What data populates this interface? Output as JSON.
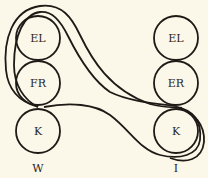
{
  "diagram": {
    "columns": [
      {
        "label": "W",
        "nodes": [
          "EL",
          "FR",
          "K"
        ]
      },
      {
        "label": "I",
        "nodes": [
          "EL",
          "ER",
          "K"
        ]
      }
    ],
    "colors": {
      "background": "#fbf7e9",
      "stroke": "#1e1a16",
      "text": "#2b2722"
    }
  }
}
